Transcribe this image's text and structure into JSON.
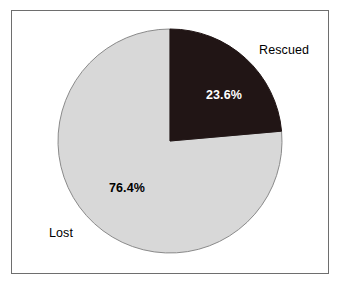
{
  "chart_data": {
    "type": "pie",
    "title": "",
    "subtitle": "",
    "xlabel": "",
    "ylabel": "",
    "grid": false,
    "legend_position": "none",
    "start_angle_deg": 0,
    "direction": "clockwise",
    "categories": [
      "Rescued",
      "Lost"
    ],
    "values": [
      23.6,
      76.4
    ],
    "unit": "%",
    "slices": [
      {
        "name": "Rescued",
        "value": 23.6,
        "value_label": "23.6%",
        "category_label": "Rescued",
        "color": "#211515",
        "label_color": "#ffffff",
        "label_position": "inside",
        "category_label_position": "outside-right",
        "start_angle_deg": 0,
        "end_angle_deg": 84.96
      },
      {
        "name": "Lost",
        "value": 76.4,
        "value_label": "76.4%",
        "category_label": "Lost",
        "color": "#d8d8d8",
        "label_color": "#000000",
        "label_position": "inside",
        "category_label_position": "outside-left",
        "start_angle_deg": 84.96,
        "end_angle_deg": 360
      }
    ]
  },
  "labels": {
    "rescued_category": "Rescued",
    "rescued_value": "23.6%",
    "lost_category": "Lost",
    "lost_value": "76.4%"
  },
  "colors": {
    "rescued_slice": "#211515",
    "lost_slice": "#d8d8d8",
    "slice_outline": "#8a8a8a",
    "frame_border": "#6e6e6e",
    "background": "#ffffff",
    "text_dark": "#000000",
    "text_light": "#ffffff"
  },
  "geometry": {
    "center_x": 170,
    "center_y": 141,
    "radius": 112
  }
}
